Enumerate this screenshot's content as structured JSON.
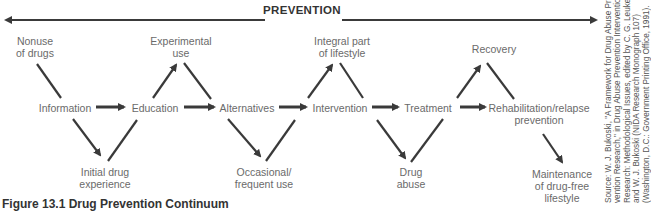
{
  "diagram": {
    "title": "PREVENTION",
    "caption": "Figure 13.1 Drug Prevention Continuum",
    "nodes": {
      "nonuse": [
        "Nonuse",
        "of drugs"
      ],
      "experimental": [
        "Experimental",
        "use"
      ],
      "integral": [
        "Integral part",
        "of lifestyle"
      ],
      "recovery": [
        "Recovery"
      ],
      "information": [
        "Information"
      ],
      "education": [
        "Education"
      ],
      "alternatives": [
        "Alternatives"
      ],
      "intervention": [
        "Intervention"
      ],
      "treatment": [
        "Treatment"
      ],
      "rehab": [
        "Rehabilitation/relapse",
        "prevention"
      ],
      "initial": [
        "Initial drug",
        "experience"
      ],
      "occasional": [
        "Occasional/",
        "frequent use"
      ],
      "abuse": [
        "Drug",
        "abuse"
      ],
      "maintenance": [
        "Maintenance",
        "of drug-free",
        "lifestyle"
      ]
    },
    "source": [
      "Source: W. J. Bukoski, \"A Framework for Drug Abuse Pre-",
      "vention Research,\" in Drug Abuse Prevention Intervention",
      "Research: Methodological Issues, edited by C. G. Leukefeld",
      "and W. J. Bukoski (NIDA Research Monograph 107)",
      "(Washington, D.C.: Government Printing Office, 1991)."
    ]
  }
}
